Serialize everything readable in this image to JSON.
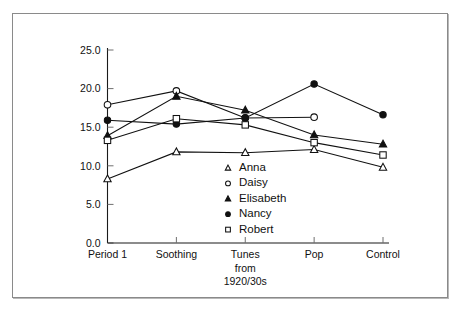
{
  "chart_data": {
    "type": "line",
    "title": "",
    "subtitle": "",
    "xlabel": "",
    "ylabel": "",
    "xlim_categories": [
      "Period 1",
      "Soothing",
      "Tunes from 1920/30s",
      "Pop",
      "Control"
    ],
    "categories": [
      "Period 1",
      "Soothing",
      "Tunes\nfrom\n1920/30s",
      "Pop",
      "Control"
    ],
    "category_lines": [
      [
        "Period 1"
      ],
      [
        "Soothing"
      ],
      [
        "Tunes",
        "from",
        "1920/30s"
      ],
      [
        "Pop"
      ],
      [
        "Control"
      ]
    ],
    "ylim": [
      0.0,
      25.0
    ],
    "yticks": [
      0.0,
      5.0,
      10.0,
      15.0,
      20.0,
      25.0
    ],
    "ytick_labels": [
      "0.0",
      "5.0",
      "10.0",
      "15.0",
      "20.0",
      "25.0"
    ],
    "grid": false,
    "legend_position": "center",
    "series": [
      {
        "name": "Anna",
        "marker": "open-triangle",
        "color": "#111111",
        "values": [
          8.3,
          11.8,
          11.7,
          12.1,
          9.8
        ]
      },
      {
        "name": "Daisy",
        "marker": "open-circle",
        "color": "#111111",
        "values": [
          17.9,
          19.7,
          16.2,
          16.3,
          null
        ]
      },
      {
        "name": "Elisabeth",
        "marker": "filled-triangle",
        "color": "#111111",
        "values": [
          13.9,
          19.0,
          17.2,
          14.0,
          12.8
        ]
      },
      {
        "name": "Nancy",
        "marker": "filled-circle",
        "color": "#111111",
        "values": [
          15.9,
          15.4,
          16.2,
          20.6,
          16.6
        ]
      },
      {
        "name": "Robert",
        "marker": "open-square",
        "color": "#111111",
        "values": [
          13.3,
          16.1,
          15.3,
          13.0,
          11.4
        ]
      }
    ],
    "legend_entries": [
      {
        "label": "Anna",
        "marker": "open-triangle"
      },
      {
        "label": "Daisy",
        "marker": "open-circle"
      },
      {
        "label": "Elisabeth",
        "marker": "filled-triangle"
      },
      {
        "label": "Nancy",
        "marker": "filled-circle"
      },
      {
        "label": "Robert",
        "marker": "open-square"
      }
    ],
    "colors": {
      "axis": "#111111",
      "line": "#111111",
      "marker_fill_open": "#ffffff",
      "marker_fill_solid": "#111111",
      "frame_border": "#8a8a8a",
      "background": "#ffffff"
    }
  }
}
